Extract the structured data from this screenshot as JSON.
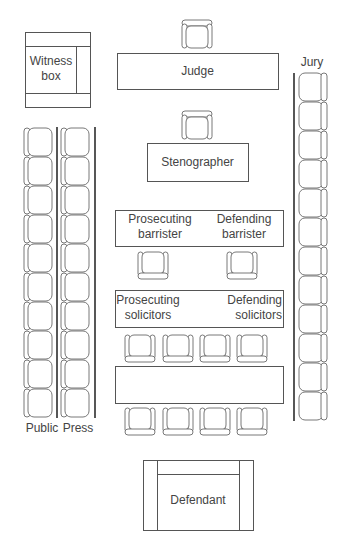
{
  "diagram": {
    "labels": {
      "witness_box_line1": "Witness",
      "witness_box_line2": "box",
      "judge": "Judge",
      "jury": "Jury",
      "stenographer": "Stenographer",
      "prosecuting_barrister_line1": "Prosecuting",
      "prosecuting_barrister_line2": "barrister",
      "defending_barrister_line1": "Defending",
      "defending_barrister_line2": "barrister",
      "prosecuting_solicitors_line1": "Prosecuting",
      "prosecuting_solicitors_line2": "solicitors",
      "defending_solicitors_line1": "Defending",
      "defending_solicitors_line2": "solicitors",
      "public": "Public",
      "press": "Press",
      "defendant": "Defendant"
    },
    "seat_counts": {
      "judge": 1,
      "stenographer": 1,
      "barristers": 2,
      "solicitors_front_row": 4,
      "solicitors_back_row": 4,
      "public": 10,
      "press": 10,
      "jury": 12
    },
    "colors": {
      "line": "#555555",
      "background": "#ffffff"
    }
  }
}
